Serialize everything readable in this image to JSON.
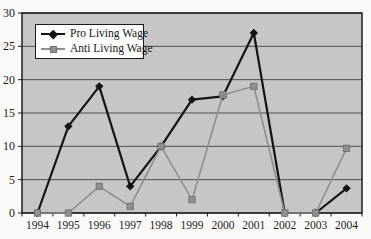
{
  "chart_data": {
    "type": "line",
    "categories": [
      "1994",
      "1995",
      "1996",
      "1997",
      "1998",
      "1999",
      "2000",
      "2001",
      "2002",
      "2003",
      "2004"
    ],
    "series": [
      {
        "name": "Pro Living Wage",
        "marker": "diamond",
        "color": "#141414",
        "values": [
          0,
          13,
          19,
          4,
          10,
          17,
          17.5,
          27,
          0,
          0,
          3.7
        ]
      },
      {
        "name": "Anti Living Wage",
        "marker": "square",
        "color": "#8e8e8e",
        "values": [
          0,
          0,
          4,
          1,
          10,
          2,
          17.7,
          19,
          0,
          0,
          9.7
        ]
      }
    ],
    "title": "",
    "xlabel": "",
    "ylabel": "",
    "ylim": [
      0,
      30
    ],
    "y_ticks": [
      0,
      5,
      10,
      15,
      20,
      25,
      30
    ],
    "grid": true,
    "legend_position": "top-left",
    "plot_background": "#c6c6c6",
    "gridline_color": "#4d4d4d",
    "axis_color": "#1c1c1c"
  }
}
